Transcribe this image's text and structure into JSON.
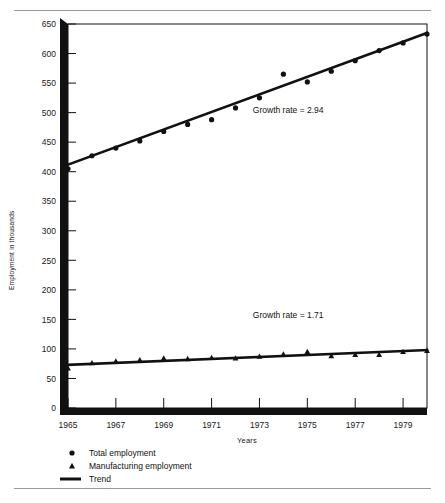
{
  "figure": {
    "rules": [
      "top-rule",
      "bottom-rule"
    ]
  },
  "chart_data": {
    "type": "scatter",
    "title": "",
    "xlabel": "Years",
    "ylabel": "Employment in thousands",
    "xlim": [
      1965,
      1980
    ],
    "ylim": [
      0,
      650
    ],
    "xticks": [
      "1965",
      "1967",
      "1969",
      "1971",
      "1973",
      "1975",
      "1977",
      "1979"
    ],
    "xtick_values": [
      1965,
      1967,
      1969,
      1971,
      1973,
      1975,
      1977,
      1979
    ],
    "yticks": [
      "0",
      "50",
      "100",
      "150",
      "200",
      "250",
      "300",
      "350",
      "400",
      "450",
      "500",
      "550",
      "600",
      "650"
    ],
    "ytick_values": [
      0,
      50,
      100,
      150,
      200,
      250,
      300,
      350,
      400,
      450,
      500,
      550,
      600,
      650
    ],
    "grid": false,
    "legend_position": "below-axes",
    "x": [
      1965,
      1966,
      1967,
      1968,
      1969,
      1970,
      1971,
      1972,
      1973,
      1974,
      1975,
      1976,
      1977,
      1978,
      1979,
      1980
    ],
    "series": [
      {
        "name": "Total employment",
        "marker": "circle",
        "values": [
          405,
          427,
          440,
          452,
          468,
          480,
          488,
          508,
          525,
          565,
          552,
          570,
          588,
          605,
          618,
          633
        ]
      },
      {
        "name": "Manufacturing employment",
        "marker": "triangle",
        "values": [
          67,
          76,
          79,
          81,
          84,
          83,
          85,
          84,
          87,
          91,
          95,
          88,
          90,
          90,
          95,
          97
        ]
      },
      {
        "name": "Trend",
        "marker": "line",
        "fit_for": "Total employment",
        "endpoints": [
          [
            1965,
            412
          ],
          [
            1980,
            635
          ]
        ]
      },
      {
        "name": "Trend",
        "marker": "line",
        "fit_for": "Manufacturing employment",
        "endpoints": [
          [
            1965,
            73
          ],
          [
            1980,
            98
          ]
        ]
      }
    ],
    "annotations": [
      {
        "text": "Growth rate = 2.94",
        "x": 1974.2,
        "y": 500
      },
      {
        "text": "Growth rate = 1.71",
        "x": 1974.2,
        "y": 152
      }
    ],
    "legend": [
      {
        "marker": "circle",
        "label": "Total employment"
      },
      {
        "marker": "triangle",
        "label": "Manufacturing employment"
      },
      {
        "marker": "line",
        "label": "Trend"
      }
    ]
  }
}
